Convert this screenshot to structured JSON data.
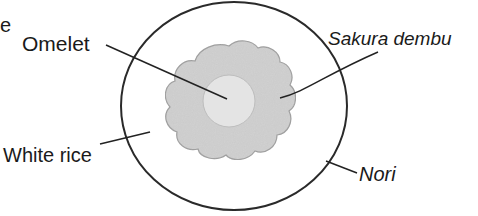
{
  "diagram": {
    "title_fragment": "e",
    "labels": {
      "omelet": "Omelet",
      "sakura_dembu": "Sakura dembu",
      "white_rice": "White rice",
      "nori": "Nori"
    },
    "colors": {
      "outline": "#2a2a2a",
      "sakura_fill": "#d4d4d4",
      "omelet_fill": "#e6e6e6",
      "rice_fill": "#ffffff"
    }
  }
}
